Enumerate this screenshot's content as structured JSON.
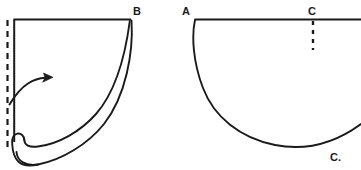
{
  "figure": {
    "type": "line-drawing",
    "background_color": "#ffffff",
    "stroke_color": "#1a1a1a",
    "canvas": {
      "width": 361,
      "height": 170
    },
    "panels": [
      {
        "id": "left-panel",
        "description": "rolled sheet with curl at bottom-left and fold arrow",
        "labels": [
          {
            "id": "label-b",
            "text": "B",
            "x": 133,
            "y": 6
          }
        ],
        "dashed_line": {
          "x": 7,
          "y_start": 20,
          "y_end": 148
        },
        "arrow": {
          "from_x": 10,
          "from_y": 103,
          "to_x": 52,
          "to_y": 78
        }
      },
      {
        "id": "right-panel",
        "description": "flat sheet sagging into a draped arc",
        "labels": [
          {
            "id": "label-a",
            "text": "A",
            "x": 182,
            "y": 6
          },
          {
            "id": "label-c-top",
            "text": "C",
            "x": 308,
            "y": 6
          },
          {
            "id": "label-c-bottom",
            "text": "C.",
            "x": 330,
            "y": 152
          }
        ],
        "dashed_line": {
          "x": 313,
          "y_start": 22,
          "y_end": 50
        }
      }
    ]
  },
  "labels": {
    "b": "B",
    "a": "A",
    "c_top": "C",
    "c_bottom": "C."
  }
}
